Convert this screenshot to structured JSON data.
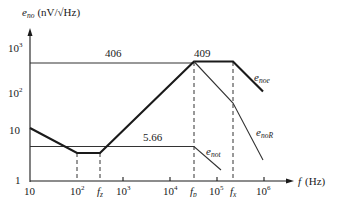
{
  "diagram": {
    "type": "bode-noise-asymptote-plot",
    "y_axis": {
      "label_main": "e",
      "label_sub": "no",
      "label_units": "(nV/√Hz)",
      "ticks": [
        {
          "base": "10",
          "exp": "3"
        },
        {
          "base": "10",
          "exp": "2"
        },
        {
          "base": "10",
          "exp": ""
        },
        {
          "base": "1",
          "exp": ""
        }
      ]
    },
    "x_axis": {
      "label_var": "f",
      "label_units": "(Hz)",
      "ticks": [
        {
          "base": "10",
          "exp": ""
        },
        {
          "base": "10",
          "exp": "2"
        },
        {
          "base": "f",
          "sub": "z"
        },
        {
          "base": "10",
          "exp": "3"
        },
        {
          "base": "10",
          "exp": "4"
        },
        {
          "base": "f",
          "sub": "p"
        },
        {
          "base": "10",
          "exp": "5"
        },
        {
          "base": "f",
          "sub": "x"
        },
        {
          "base": "10",
          "exp": "6"
        }
      ]
    },
    "annotations": {
      "level_406": "406",
      "level_409": "409",
      "level_566": "5.66"
    },
    "curves": {
      "noe": {
        "main": "e",
        "sub": "noe"
      },
      "noR": {
        "main": "e",
        "sub": "noR"
      },
      "not": {
        "main": "e",
        "sub": "not"
      }
    }
  }
}
